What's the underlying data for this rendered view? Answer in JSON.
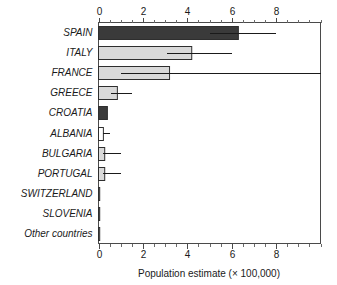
{
  "chart_data": {
    "type": "bar",
    "orientation": "horizontal",
    "title": "",
    "xlabel": "Population estimate (× 100,000)",
    "ylabel": "",
    "xlim": [
      0,
      10
    ],
    "ylim": null,
    "grid": false,
    "legend": null,
    "x_ticks": [
      0,
      2,
      4,
      6,
      8
    ],
    "x_tick_labels": [
      "0",
      "2",
      "4",
      "6",
      "8"
    ],
    "x_minor_tick_step": 0.5,
    "axis_positions": [
      "top",
      "bottom"
    ],
    "categories": [
      "SPAIN",
      "ITALY",
      "FRANCE",
      "GREECE",
      "CROATIA",
      "ALBANIA",
      "BULGARIA",
      "PORTUGAL",
      "SWITZERLAND",
      "SLOVENIA",
      "Other countries"
    ],
    "values": [
      6.3,
      4.2,
      3.2,
      0.85,
      0.4,
      0.22,
      0.28,
      0.28,
      0.03,
      0.03,
      0.02
    ],
    "error_low": [
      5.0,
      3.1,
      1.0,
      0.55,
      null,
      0.22,
      0.22,
      0.22,
      null,
      null,
      null
    ],
    "error_high": [
      8.0,
      6.0,
      10.2,
      1.5,
      null,
      0.52,
      1.0,
      1.0,
      null,
      null,
      null
    ],
    "bar_fills": [
      "#3a3a3a",
      "#d9d9d9",
      "#d9d9d9",
      "#d9d9d9",
      "#3a3a3a",
      "#ffffff",
      "#d9d9d9",
      "#d9d9d9",
      "#9a9a9a",
      "#6a6a6a",
      "#9a9a9a"
    ]
  },
  "colors": {
    "dark_bar": "#3a3a3a",
    "light_bar": "#d9d9d9",
    "empty_bar": "#ffffff",
    "axis": "#4a4a4a",
    "text": "#1a1a1a",
    "background": "#ffffff"
  }
}
